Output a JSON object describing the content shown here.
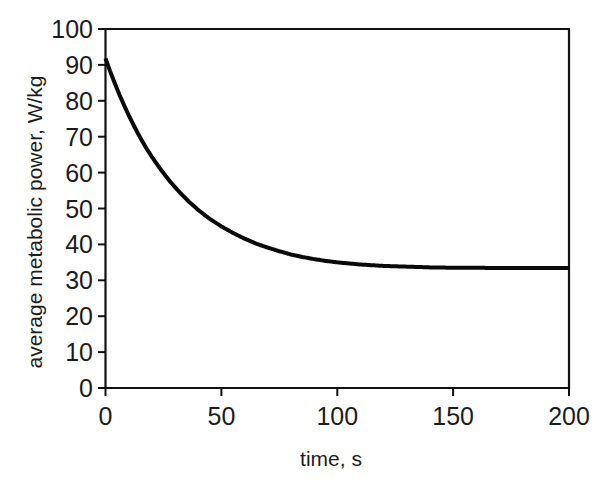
{
  "figure": {
    "background_color": "#ffffff",
    "ink_color": "#111111"
  },
  "chart_data": {
    "type": "line",
    "title": "",
    "xlabel": "time, s",
    "ylabel": "average metabolic power, W/kg",
    "xlim": [
      0,
      200
    ],
    "ylim": [
      0,
      100
    ],
    "xticks": [
      0,
      50,
      100,
      150,
      200
    ],
    "yticks": [
      0,
      10,
      20,
      30,
      40,
      50,
      60,
      70,
      80,
      90,
      100
    ],
    "xtick_labels": [
      "0",
      "50",
      "100",
      "150",
      "200"
    ],
    "ytick_labels": [
      "0",
      "10",
      "20",
      "30",
      "40",
      "50",
      "60",
      "70",
      "80",
      "90",
      "100"
    ],
    "grid": false,
    "legend": null,
    "legend_position": "none",
    "box_frame": true,
    "series": [
      {
        "name": "average metabolic power",
        "color": "#0a0a0a",
        "line_width": 4,
        "marker": "none",
        "x": [
          0,
          2,
          4,
          6,
          8,
          10,
          12,
          14,
          16,
          18,
          20,
          24,
          28,
          32,
          36,
          40,
          45,
          50,
          55,
          60,
          65,
          70,
          75,
          80,
          85,
          90,
          95,
          100,
          110,
          120,
          130,
          140,
          150,
          160,
          170,
          180,
          190,
          200
        ],
        "y": [
          91.8,
          88.2,
          84.9,
          81.7,
          78.8,
          76.0,
          73.4,
          70.9,
          68.6,
          66.4,
          64.4,
          60.7,
          57.4,
          54.5,
          51.9,
          49.6,
          47.1,
          45.0,
          43.2,
          41.6,
          40.2,
          39.1,
          38.1,
          37.2,
          36.5,
          35.9,
          35.4,
          35.0,
          34.4,
          34.0,
          33.8,
          33.6,
          33.5,
          33.5,
          33.4,
          33.4,
          33.4,
          33.4
        ]
      }
    ],
    "annotations": [],
    "notes": {
      "initial_value": 91.8,
      "asymptote": 33.4,
      "shape": "exponential decay"
    }
  },
  "axes": {
    "x_tick_0": "0",
    "x_tick_1": "50",
    "x_tick_2": "100",
    "x_tick_3": "150",
    "x_tick_4": "200",
    "y_tick_0": "0",
    "y_tick_10": "10",
    "y_tick_20": "20",
    "y_tick_30": "30",
    "y_tick_40": "40",
    "y_tick_50": "50",
    "y_tick_60": "60",
    "y_tick_70": "70",
    "y_tick_80": "80",
    "y_tick_90": "90",
    "y_tick_100": "100",
    "x_axis_title": "time, s",
    "y_axis_title": "average metabolic power, W/kg"
  }
}
